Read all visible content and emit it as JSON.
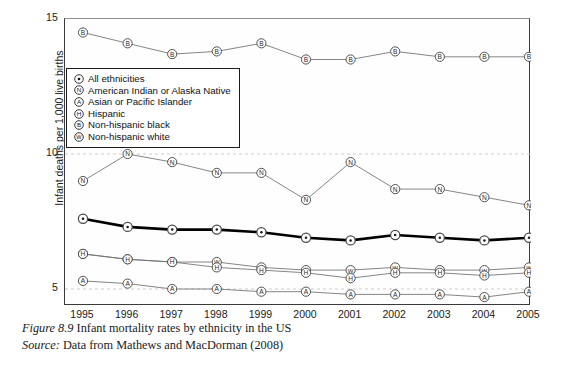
{
  "figure": {
    "caption_prefix": "Figure 8.9",
    "caption_text": "Infant mortality rates by ethnicity in the US",
    "source_prefix": "Source:",
    "source_text": "Data from Mathews and MacDorman (2008)"
  },
  "axes": {
    "y_title": "Infant deaths per 1,000 live births",
    "y_ticks": [
      "15",
      "10",
      "5"
    ],
    "x_ticks": [
      "1995",
      "1996",
      "1997",
      "1998",
      "1999",
      "2000",
      "2001",
      "2002",
      "2003",
      "2004",
      "2005"
    ]
  },
  "legend": {
    "items": [
      {
        "glyph": "O",
        "marker": "dot-in-circle",
        "label": "All ethnicities"
      },
      {
        "glyph": "N",
        "marker": "circled-letter-N",
        "label": "American Indian or Alaska Native"
      },
      {
        "glyph": "A",
        "marker": "circled-letter-A",
        "label": "Asian or Pacific Islander"
      },
      {
        "glyph": "H",
        "marker": "circled-letter-H",
        "label": "Hispanic"
      },
      {
        "glyph": "B",
        "marker": "circled-letter-B",
        "label": "Non-hispanic black"
      },
      {
        "glyph": "W",
        "marker": "circled-letter-W",
        "label": "Non-hispanic white"
      }
    ]
  },
  "chart_data": {
    "type": "line",
    "title": "Infant mortality rates by ethnicity in the US",
    "xlabel": "",
    "ylabel": "Infant deaths per 1,000 live births",
    "x": [
      1995,
      1996,
      1997,
      1998,
      1999,
      2000,
      2001,
      2002,
      2003,
      2004,
      2005
    ],
    "ylim": [
      4.4,
      15.0
    ],
    "xlim": [
      1994.6,
      2005.4
    ],
    "grid": "horizontal-dashed-at-5-and-10",
    "legend_position": "upper-left-inside",
    "series": [
      {
        "name": "Non-hispanic black",
        "key": "B",
        "values": [
          14.5,
          14.1,
          13.7,
          13.8,
          14.1,
          13.5,
          13.5,
          13.8,
          13.6,
          13.6,
          13.6
        ],
        "emphasis": "normal"
      },
      {
        "name": "American Indian or Alaska Native",
        "key": "N",
        "values": [
          9.0,
          10.0,
          9.7,
          9.3,
          9.3,
          8.3,
          9.7,
          8.7,
          8.7,
          8.4,
          8.1
        ],
        "emphasis": "normal"
      },
      {
        "name": "All ethnicities",
        "key": "O",
        "values": [
          7.6,
          7.3,
          7.2,
          7.2,
          7.1,
          6.9,
          6.8,
          7.0,
          6.9,
          6.8,
          6.9
        ],
        "emphasis": "bold"
      },
      {
        "name": "Non-hispanic white",
        "key": "W",
        "values": [
          6.3,
          6.1,
          6.0,
          6.0,
          5.8,
          5.7,
          5.7,
          5.8,
          5.7,
          5.7,
          5.8
        ],
        "emphasis": "normal"
      },
      {
        "name": "Hispanic",
        "key": "H",
        "values": [
          6.3,
          6.1,
          6.0,
          5.8,
          5.7,
          5.6,
          5.4,
          5.6,
          5.6,
          5.5,
          5.6
        ],
        "emphasis": "normal"
      },
      {
        "name": "Asian or Pacific Islander",
        "key": "A",
        "values": [
          5.3,
          5.2,
          5.0,
          5.0,
          4.9,
          4.9,
          4.8,
          4.8,
          4.8,
          4.7,
          4.9
        ],
        "emphasis": "normal"
      }
    ]
  },
  "colors": {
    "line": "#6f6f6f",
    "bold_line": "#000000",
    "marker_stroke": "#4a4a4a",
    "gridline": "#d8c8c8",
    "axis": "#3a3a3a",
    "text": "#1a1a1a"
  }
}
